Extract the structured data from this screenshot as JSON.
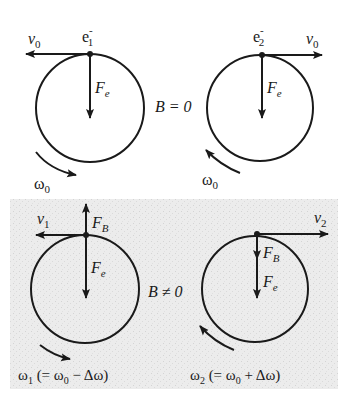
{
  "diagram": {
    "top_row": {
      "condition_label": "B = 0",
      "left": {
        "electron_label": "e",
        "electron_sup": "-",
        "electron_sub": "1",
        "velocity_label": "v",
        "velocity_sub": "0",
        "velocity_direction": "left",
        "force_label": "F",
        "force_sub": "e",
        "omega_label": "ω",
        "omega_sub": "0",
        "rotation": "counterclockwise"
      },
      "right": {
        "electron_label": "e",
        "electron_sup": "-",
        "electron_sub": "2",
        "velocity_label": "v",
        "velocity_sub": "0",
        "velocity_direction": "right",
        "force_label": "F",
        "force_sub": "e",
        "omega_label": "ω",
        "omega_sub": "0",
        "rotation": "clockwise"
      }
    },
    "bottom_row": {
      "condition_label": "B ≠ 0",
      "left": {
        "velocity_label": "v",
        "velocity_sub": "1",
        "magnetic_force_label": "F",
        "magnetic_force_sub": "B",
        "magnetic_force_direction": "up",
        "force_label": "F",
        "force_sub": "e",
        "omega_label": "ω",
        "omega_sub": "1",
        "omega_expr": " (= ω",
        "omega_expr_sub": "0",
        "omega_expr_tail": " − Δω)"
      },
      "right": {
        "velocity_label": "v",
        "velocity_sub": "2",
        "magnetic_force_label": "F",
        "magnetic_force_sub": "B",
        "magnetic_force_direction": "down",
        "force_label": "F",
        "force_sub": "e",
        "omega_label": "ω",
        "omega_sub": "2",
        "omega_expr": " (= ω",
        "omega_expr_sub": "0",
        "omega_expr_tail": " + Δω)"
      }
    },
    "colors": {
      "ink": "#1a1a1a",
      "panel_bg": "#ebebeb",
      "page_bg": "#ffffff"
    }
  }
}
